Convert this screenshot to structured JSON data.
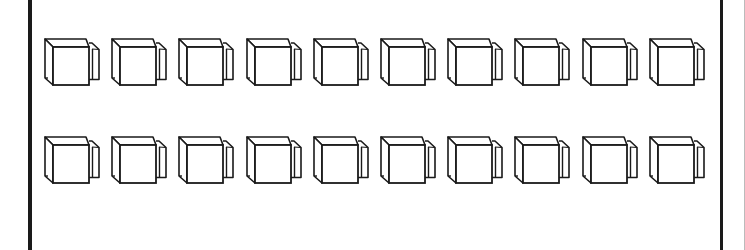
{
  "figure": {
    "rows": 2,
    "cubes_per_row": 10,
    "total_cubes": 20,
    "shape": "cube-with-side-block",
    "line_color": "#1a1a1a",
    "background_color": "#ffffff",
    "row_y": [
      39,
      137
    ],
    "col_x": [
      45,
      112,
      179,
      247,
      314,
      381,
      448,
      515,
      583,
      650
    ]
  }
}
